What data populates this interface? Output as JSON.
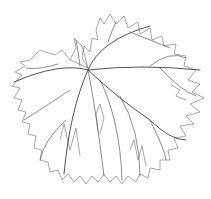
{
  "figure": {
    "stroke_color": "#6b6b6b",
    "background": "#ffffff",
    "caption": ""
  }
}
